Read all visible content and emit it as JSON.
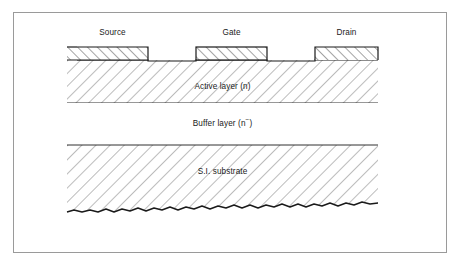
{
  "figure": {
    "kind": "semiconductor-cross-section",
    "border_color": "#9a9a9a",
    "background": "#ffffff",
    "line_color": "#1a1a1a",
    "hatch_color": "#555555"
  },
  "electrodes": [
    {
      "id": "source",
      "label": "Source",
      "x": 77,
      "y": 47,
      "width": 71,
      "height": 13,
      "hatch": "forward-slash",
      "label_cx": 112,
      "label_y": 34
    },
    {
      "id": "gate",
      "label": "Gate",
      "x": 196,
      "y": 47,
      "width": 71,
      "height": 13,
      "hatch": "forward-slash",
      "label_cx": 231,
      "label_y": 34
    },
    {
      "id": "drain",
      "label": "Drain",
      "x": 315,
      "y": 47,
      "width": 63,
      "height": 13,
      "hatch": "forward-slash",
      "label_cx": 346,
      "label_y": 34
    }
  ],
  "layers": [
    {
      "id": "active-layer",
      "label": "Active layer (n)",
      "label_text_main": "Active layer (n)",
      "top": 60,
      "bottom": 103,
      "left": 67,
      "right": 378,
      "hatch": "back-slash",
      "label_cx": 232,
      "label_cy": 87
    },
    {
      "id": "buffer-layer",
      "label": "Buffer layer (n−)",
      "label_text_main": "Buffer layer (n",
      "label_text_sup": "−",
      "label_text_tail": ")",
      "top": 103,
      "bottom": 145,
      "left": 67,
      "right": 378,
      "hatch": "none",
      "label_cx": 232,
      "label_cy": 124
    },
    {
      "id": "si-substrate",
      "label": "S.I. substrate",
      "label_text_main": "S.I. substrate",
      "top": 145,
      "bottom": 207,
      "left": 67,
      "right": 378,
      "hatch": "back-slash",
      "label_cx": 232,
      "label_cy": 172
    }
  ],
  "substrate_bottom_edge": {
    "style": "irregular-broken-line",
    "description": "jagged hand-drawn lower boundary of the semi-insulating substrate"
  }
}
